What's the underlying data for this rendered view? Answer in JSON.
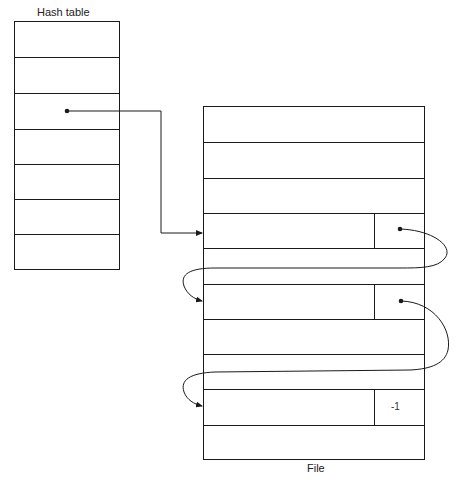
{
  "hash_table": {
    "title": "Hash table",
    "row_count": 7,
    "pointer_row_index": 2
  },
  "file": {
    "title": "File",
    "row_count": 10,
    "linked_rows": [
      {
        "row_index": 3,
        "pointer": "next"
      },
      {
        "row_index": 5,
        "pointer": "next"
      },
      {
        "row_index": 8,
        "pointer": "-1"
      }
    ],
    "end_marker": "-1"
  },
  "colors": {
    "line": "#1a1a1a",
    "background": "#ffffff"
  }
}
